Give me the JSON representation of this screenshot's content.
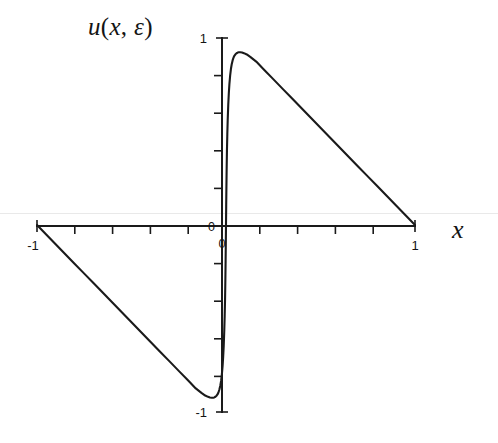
{
  "figure": {
    "background": "#ffffff",
    "ink_color": "#1a1a1a"
  },
  "labels": {
    "y_axis_title": "u(x, ε)",
    "y_axis_title_parts": {
      "u": "u",
      "open_paren": "(",
      "x": "x",
      "comma": ",",
      "epsilon": "ε",
      "close_paren": ")"
    },
    "x_axis_title": "x",
    "y_tick_top": "1",
    "y_tick_bottom": "-1",
    "y_tick_zero": "0",
    "x_tick_left": "-1",
    "x_tick_right": "1",
    "x_tick_zero": "0"
  },
  "chart_data": {
    "type": "line",
    "title": "",
    "subtitle": "",
    "xlabel": "x",
    "ylabel": "u(x, ε)",
    "xlim": [
      -1,
      1
    ],
    "ylim": [
      -1,
      1
    ],
    "grid": false,
    "legend": null,
    "x_ticks": [
      -1,
      -0.8,
      -0.6,
      -0.4,
      -0.2,
      0,
      0.2,
      0.4,
      0.6,
      0.8,
      1
    ],
    "x_tick_labels": [
      "-1",
      "",
      "",
      "",
      "",
      "0",
      "",
      "",
      "",
      "",
      "1"
    ],
    "y_ticks": [
      -1,
      -0.8,
      -0.6,
      -0.4,
      -0.2,
      0,
      0.2,
      0.4,
      0.6,
      0.8,
      1
    ],
    "y_tick_labels": [
      "-1",
      "",
      "",
      "",
      "",
      "0",
      "",
      "",
      "",
      "",
      "1"
    ],
    "annotations": [
      "sharp interior layer at x = 0",
      "odd symmetric solution"
    ],
    "series": [
      {
        "name": "u(x, ε)",
        "color": "#1a1a1a",
        "x": [
          -1.0,
          -0.95,
          -0.9,
          -0.85,
          -0.8,
          -0.75,
          -0.7,
          -0.65,
          -0.6,
          -0.55,
          -0.5,
          -0.45,
          -0.4,
          -0.35,
          -0.3,
          -0.25,
          -0.2,
          -0.16,
          -0.13,
          -0.11,
          -0.095,
          -0.085,
          -0.075,
          -0.068,
          -0.062,
          -0.056,
          -0.05,
          -0.045,
          -0.04,
          -0.035,
          -0.03,
          -0.026,
          -0.022,
          -0.018,
          -0.015,
          -0.012,
          -0.009,
          -0.007,
          -0.005,
          -0.0035,
          -0.002,
          -0.001,
          0.0,
          0.001,
          0.002,
          0.0035,
          0.005,
          0.007,
          0.009,
          0.012,
          0.015,
          0.018,
          0.022,
          0.026,
          0.03,
          0.035,
          0.04,
          0.045,
          0.05,
          0.056,
          0.062,
          0.068,
          0.075,
          0.085,
          0.095,
          0.11,
          0.13,
          0.16,
          0.2,
          0.25,
          0.3,
          0.35,
          0.4,
          0.45,
          0.5,
          0.55,
          0.6,
          0.65,
          0.7,
          0.75,
          0.8,
          0.85,
          0.9,
          0.95,
          1.0
        ],
        "y": [
          0.0,
          -0.052,
          -0.104,
          -0.156,
          -0.208,
          -0.26,
          -0.312,
          -0.364,
          -0.416,
          -0.468,
          -0.52,
          -0.572,
          -0.624,
          -0.676,
          -0.728,
          -0.78,
          -0.832,
          -0.874,
          -0.898,
          -0.912,
          -0.919,
          -0.9225,
          -0.924,
          -0.9235,
          -0.922,
          -0.9185,
          -0.913,
          -0.906,
          -0.896,
          -0.88,
          -0.858,
          -0.834,
          -0.8,
          -0.753,
          -0.706,
          -0.645,
          -0.56,
          -0.487,
          -0.395,
          -0.302,
          -0.19,
          -0.1,
          0.0,
          0.1,
          0.19,
          0.302,
          0.395,
          0.487,
          0.56,
          0.645,
          0.706,
          0.753,
          0.8,
          0.834,
          0.858,
          0.88,
          0.896,
          0.906,
          0.913,
          0.9185,
          0.922,
          0.9235,
          0.924,
          0.9225,
          0.919,
          0.912,
          0.898,
          0.874,
          0.832,
          0.78,
          0.728,
          0.676,
          0.624,
          0.572,
          0.52,
          0.468,
          0.416,
          0.364,
          0.312,
          0.26,
          0.208,
          0.156,
          0.104,
          0.052,
          0.0
        ]
      }
    ]
  },
  "geometry": {
    "origin_x_px": 222,
    "origin_y_px": 226,
    "x_left_px": 37,
    "x_right_px": 415,
    "y_top_px": 38,
    "y_bottom_px": 412
  }
}
